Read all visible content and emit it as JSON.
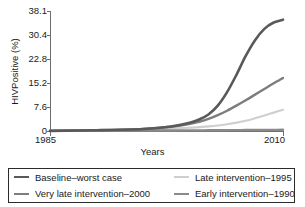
{
  "chart_data": {
    "type": "line",
    "title": "",
    "xlabel": "Years",
    "ylabel": "HIVPositive (%)",
    "xlim": [
      1985,
      2010
    ],
    "ylim": [
      0,
      38.1
    ],
    "grid": false,
    "legend_position": "bottom",
    "xticks": [
      1985,
      2010
    ],
    "xtick_labels": [
      "1985",
      "2010"
    ],
    "yticks": [
      0,
      7.6,
      15.2,
      22.8,
      30.4,
      38.1
    ],
    "ytick_labels": [
      "0",
      "7.6",
      "15.2",
      "22.8",
      "30.4",
      "38.1"
    ],
    "x": [
      1985,
      1990,
      1995,
      1998,
      2000,
      2001,
      2002,
      2003,
      2004,
      2005,
      2006,
      2007,
      2008,
      2009,
      2010
    ],
    "series": [
      {
        "name": "Baseline–worst case",
        "color": "#595959",
        "values": [
          0.2,
          0.4,
          0.8,
          1.6,
          2.8,
          3.8,
          5.4,
          8.2,
          12.5,
          18.0,
          24.0,
          29.0,
          32.6,
          34.6,
          35.5
        ]
      },
      {
        "name": "Very late intervention–2000",
        "color": "#7d7d7d",
        "values": [
          0.2,
          0.4,
          0.8,
          1.5,
          2.4,
          3.1,
          4.0,
          5.2,
          6.6,
          8.2,
          9.9,
          11.7,
          13.5,
          15.3,
          17.0
        ]
      },
      {
        "name": "Late intervention–1995",
        "color": "#cfcfcf",
        "values": [
          0.2,
          0.35,
          0.6,
          0.9,
          1.2,
          1.4,
          1.6,
          1.9,
          2.3,
          2.8,
          3.4,
          4.2,
          5.1,
          6.0,
          6.9
        ]
      },
      {
        "name": "Early intervention–1990",
        "color": "#8a8a8a",
        "values": [
          0.2,
          0.25,
          0.3,
          0.32,
          0.35,
          0.36,
          0.38,
          0.4,
          0.42,
          0.44,
          0.46,
          0.48,
          0.5,
          0.52,
          0.55
        ]
      }
    ]
  },
  "axes": {
    "ylabel": "HIVPositive (%)",
    "xlabel": "Years",
    "ytick_0": "0",
    "ytick_1": "7.6",
    "ytick_2": "15.2",
    "ytick_3": "22.8",
    "ytick_4": "30.4",
    "ytick_5": "38.1",
    "xtick_left": "1985",
    "xtick_right": "2010"
  },
  "legend": {
    "items": [
      {
        "label": "Baseline–worst case",
        "color": "#595959"
      },
      {
        "label": "Late intervention–1995",
        "color": "#cfcfcf"
      },
      {
        "label": "Very late intervention–2000",
        "color": "#7d7d7d"
      },
      {
        "label": "Early intervention–1990",
        "color": "#8a8a8a"
      }
    ]
  }
}
